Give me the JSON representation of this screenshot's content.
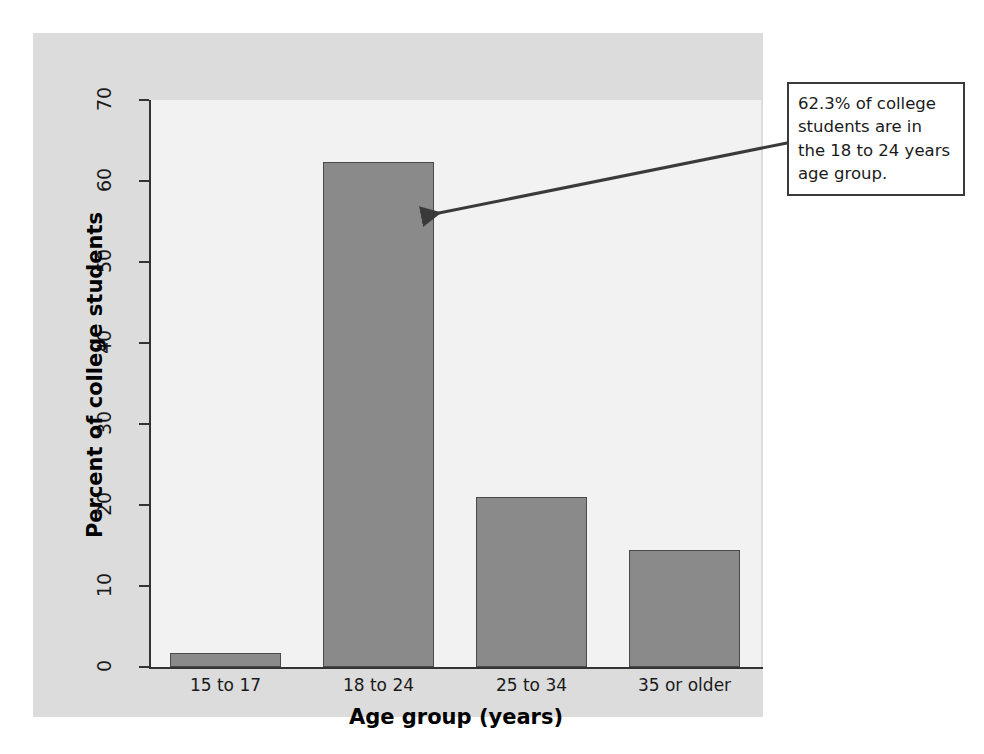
{
  "chart_data": {
    "type": "bar",
    "title": "",
    "categories": [
      "15 to 17",
      "18 to 24",
      "25 to 34",
      "35 or older"
    ],
    "values": [
      1.7,
      62.3,
      21.0,
      14.4
    ],
    "xlabel": "Age group (years)",
    "ylabel": "Percent of college students",
    "ylim": [
      0,
      70
    ],
    "yticks": [
      0,
      10,
      20,
      30,
      40,
      50,
      60,
      70
    ],
    "ytick_labels": [
      "0",
      "10",
      "20",
      "30",
      "40",
      "50",
      "60",
      "70"
    ],
    "grid": false,
    "legend": null,
    "annotations": [
      {
        "text": "62.3% of college students are in the 18 to 24 years  age group.",
        "points_to_category": "18 to 24"
      }
    ],
    "colors": {
      "bar_fill": "#8a8a8a",
      "bar_edge": "#4a4a4a",
      "plot_background": "#f2f2f2",
      "panel_background": "#dcdcdc",
      "axis": "#333333",
      "callout_border": "#3a3a3a",
      "callout_background": "#ffffff",
      "text": "#1a1a1a"
    }
  }
}
